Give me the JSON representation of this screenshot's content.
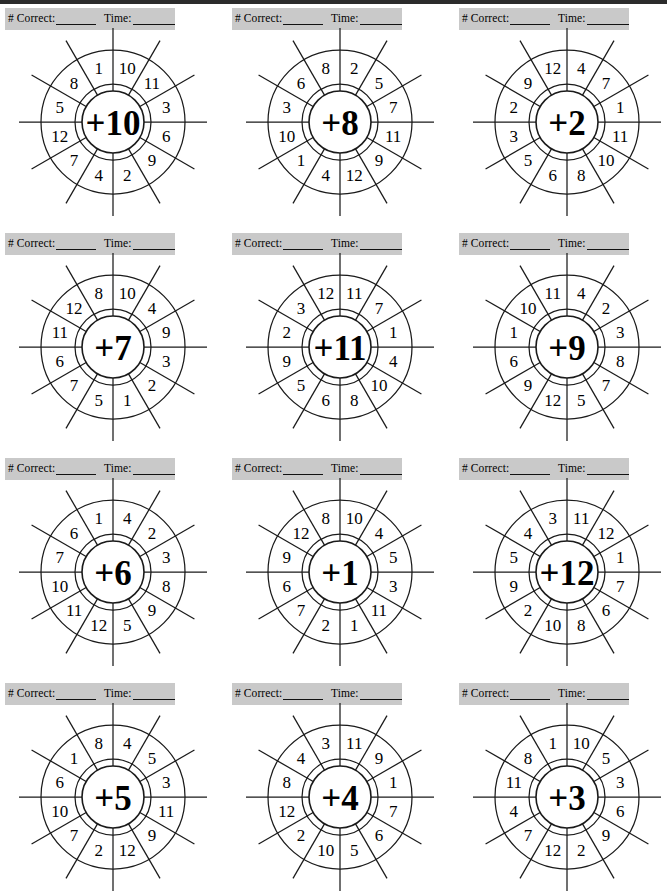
{
  "page": {
    "background_color": "#ffffff",
    "top_rule_color": "#2b2b2b",
    "band_color": "#c9c9c9",
    "ink_color": "#1a1a1a",
    "columns": 3,
    "rows": 4
  },
  "score_header": {
    "correct_label": "# Correct:",
    "time_label": "Time:",
    "correct_blank": "",
    "time_blank": ""
  },
  "wheel_geometry": {
    "segments": 12,
    "outer_radius": 72,
    "inner_radius": 38,
    "hub_radius": 31,
    "spoke_overhang": 22,
    "label_radius": 55,
    "first_segment_center_angle_deg": -75
  },
  "problems": [
    {
      "index": 1,
      "operator": "+",
      "operand": "10",
      "center_label": "+10",
      "numbers_clockwise_from_top": [
        "8",
        "1",
        "10",
        "11",
        "3",
        "6",
        "9",
        "2",
        "4",
        "7",
        "12",
        "5"
      ]
    },
    {
      "index": 2,
      "operator": "+",
      "operand": "8",
      "center_label": "+8",
      "numbers_clockwise_from_top": [
        "6",
        "8",
        "2",
        "5",
        "7",
        "11",
        "9",
        "12",
        "4",
        "1",
        "10",
        "3"
      ]
    },
    {
      "index": 3,
      "operator": "+",
      "operand": "2",
      "center_label": "+2",
      "numbers_clockwise_from_top": [
        "9",
        "12",
        "4",
        "7",
        "1",
        "11",
        "10",
        "8",
        "6",
        "5",
        "3",
        "2"
      ]
    },
    {
      "index": 4,
      "operator": "+",
      "operand": "7",
      "center_label": "+7",
      "numbers_clockwise_from_top": [
        "12",
        "8",
        "10",
        "4",
        "9",
        "3",
        "2",
        "1",
        "5",
        "7",
        "6",
        "11"
      ]
    },
    {
      "index": 5,
      "operator": "+",
      "operand": "11",
      "center_label": "+11",
      "numbers_clockwise_from_top": [
        "3",
        "12",
        "11",
        "7",
        "1",
        "4",
        "10",
        "8",
        "6",
        "5",
        "9",
        "2"
      ]
    },
    {
      "index": 6,
      "operator": "+",
      "operand": "9",
      "center_label": "+9",
      "numbers_clockwise_from_top": [
        "10",
        "11",
        "4",
        "2",
        "3",
        "8",
        "7",
        "5",
        "12",
        "9",
        "6",
        "1"
      ]
    },
    {
      "index": 7,
      "operator": "+",
      "operand": "6",
      "center_label": "+6",
      "numbers_clockwise_from_top": [
        "6",
        "1",
        "4",
        "2",
        "3",
        "8",
        "9",
        "5",
        "12",
        "11",
        "10",
        "7"
      ]
    },
    {
      "index": 8,
      "operator": "+",
      "operand": "1",
      "center_label": "+1",
      "numbers_clockwise_from_top": [
        "12",
        "8",
        "10",
        "4",
        "5",
        "3",
        "11",
        "1",
        "2",
        "7",
        "6",
        "9"
      ]
    },
    {
      "index": 9,
      "operator": "+",
      "operand": "12",
      "center_label": "+12",
      "numbers_clockwise_from_top": [
        "4",
        "3",
        "11",
        "12",
        "1",
        "7",
        "6",
        "8",
        "10",
        "2",
        "9",
        "5"
      ]
    },
    {
      "index": 10,
      "operator": "+",
      "operand": "5",
      "center_label": "+5",
      "numbers_clockwise_from_top": [
        "1",
        "8",
        "4",
        "5",
        "3",
        "11",
        "9",
        "12",
        "2",
        "7",
        "10",
        "6"
      ]
    },
    {
      "index": 11,
      "operator": "+",
      "operand": "4",
      "center_label": "+4",
      "numbers_clockwise_from_top": [
        "4",
        "3",
        "11",
        "9",
        "1",
        "7",
        "6",
        "5",
        "10",
        "2",
        "12",
        "8"
      ]
    },
    {
      "index": 12,
      "operator": "+",
      "operand": "3",
      "center_label": "+3",
      "numbers_clockwise_from_top": [
        "8",
        "1",
        "10",
        "5",
        "3",
        "6",
        "9",
        "2",
        "12",
        "7",
        "4",
        "11"
      ]
    }
  ]
}
